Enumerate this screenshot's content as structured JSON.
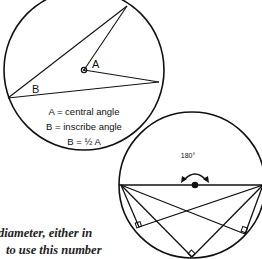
{
  "diagrams": {
    "inscribed_angle": {
      "label_A": "A",
      "label_B": "B",
      "legend": [
        "A = central angle",
        "B = inscribe angle",
        "B = ½ A"
      ]
    },
    "semicircle": {
      "arc_label": "180°"
    }
  },
  "body_text": {
    "line1": "diameter, either in",
    "line2": "to use this number"
  },
  "colors": {
    "stroke": "#111111",
    "background": "#ffffff"
  }
}
